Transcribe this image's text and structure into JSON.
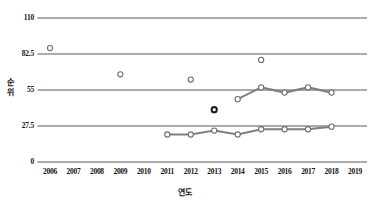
{
  "chart_data": {
    "type": "scatter",
    "title": "",
    "xlabel": "연도",
    "ylabel": "순위",
    "xlim": [
      2005.5,
      2019.5
    ],
    "ylim": [
      0,
      110
    ],
    "yticks": [
      0,
      27.5,
      55,
      82.5,
      110
    ],
    "ytick_labels": [
      "0",
      "27.5",
      "55",
      "82.5",
      "110"
    ],
    "xticks": [
      2006,
      2007,
      2008,
      2009,
      2010,
      2011,
      2012,
      2013,
      2014,
      2015,
      2016,
      2017,
      2018,
      2019
    ],
    "xtick_labels": [
      "2006",
      "2007",
      "2008",
      "2009",
      "2010",
      "2011",
      "2012",
      "2013",
      "2014",
      "2015",
      "2016",
      "2017",
      "2018",
      "2019"
    ],
    "grid": "horizontal",
    "legend": "none",
    "gridline_color": "#595959",
    "series": [
      {
        "name": "scatter-open-upper",
        "type": "scatter",
        "marker": "open-circle",
        "color": "#8c8c8c",
        "points": [
          {
            "x": 2006,
            "y": 87
          },
          {
            "x": 2009,
            "y": 67
          },
          {
            "x": 2012,
            "y": 63
          },
          {
            "x": 2015,
            "y": 78
          }
        ]
      },
      {
        "name": "scatter-filled",
        "type": "scatter",
        "marker": "dark-circle",
        "color": "#262626",
        "points": [
          {
            "x": 2013,
            "y": 40
          }
        ]
      },
      {
        "name": "line-upper",
        "type": "line",
        "marker": "open-circle",
        "color": "#808080",
        "points": [
          {
            "x": 2014,
            "y": 48
          },
          {
            "x": 2015,
            "y": 57
          },
          {
            "x": 2016,
            "y": 53
          },
          {
            "x": 2017,
            "y": 57
          },
          {
            "x": 2018,
            "y": 53
          }
        ]
      },
      {
        "name": "line-lower",
        "type": "line",
        "marker": "open-circle",
        "color": "#808080",
        "points": [
          {
            "x": 2011,
            "y": 21
          },
          {
            "x": 2012,
            "y": 21
          },
          {
            "x": 2013,
            "y": 24
          },
          {
            "x": 2014,
            "y": 21
          },
          {
            "x": 2015,
            "y": 25
          },
          {
            "x": 2016,
            "y": 25
          },
          {
            "x": 2017,
            "y": 25
          },
          {
            "x": 2018,
            "y": 27
          }
        ]
      }
    ]
  },
  "axis": {
    "y_title_chars": [
      "순",
      "위"
    ],
    "x_title": "연도"
  }
}
